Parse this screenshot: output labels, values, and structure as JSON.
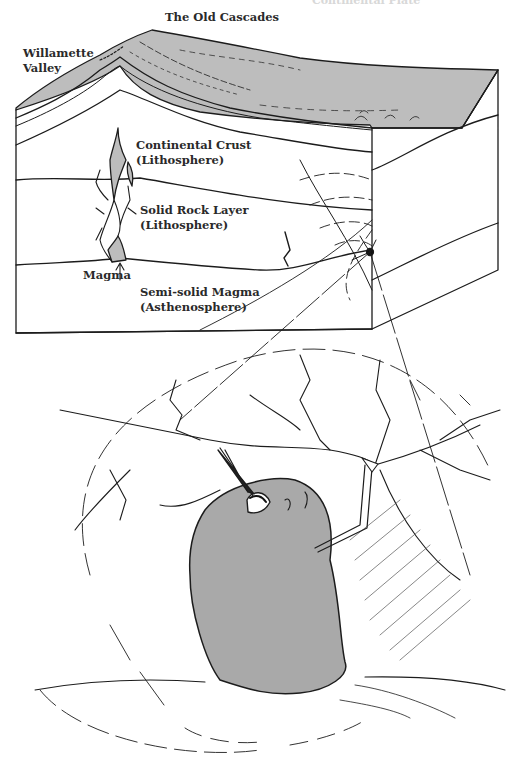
{
  "figure": {
    "cut_off_heading": "Continental Plate",
    "labels": {
      "old_cascades": "The Old Cascades",
      "willamette_line1": "Willamette",
      "willamette_line2": "Valley",
      "crust_line1": "Continental Crust",
      "crust_line2": "(Lithosphere)",
      "solid_line1": "Solid Rock Layer",
      "solid_line2": "(Lithosphere)",
      "magma": "Magma",
      "semisolid_line1": "Semi-solid Magma",
      "semisolid_line2": "(Asthenosphere)"
    },
    "colors": {
      "surface_grey": "#bdbdbd",
      "magma_blob_grey": "#a9a9a9",
      "ink": "#1c1c1c"
    }
  }
}
